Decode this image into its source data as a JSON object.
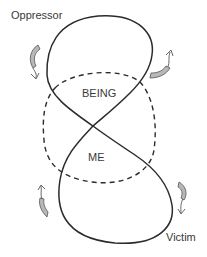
{
  "diagram": {
    "labels": {
      "oppressor": "Oppressor",
      "victim": "Victim",
      "being": "BEING",
      "me": "ME"
    },
    "elements": {
      "figure_eight": "solid closed curve crossing itself at centre (top loop = Oppressor, bottom loop = Victim)",
      "dashed_region": "dashed closed shape overlapping the crossing (BEING above, ME below)",
      "arrows": [
        "curved arrow left of top loop",
        "curved arrow right of top loop",
        "curved arrow left of bottom loop",
        "curved arrow right of bottom loop"
      ]
    },
    "colors": {
      "stroke": "#2b2b2b",
      "arrow_fill": "#b8b8b8",
      "text": "#3a3a3a",
      "background": "#ffffff"
    }
  }
}
